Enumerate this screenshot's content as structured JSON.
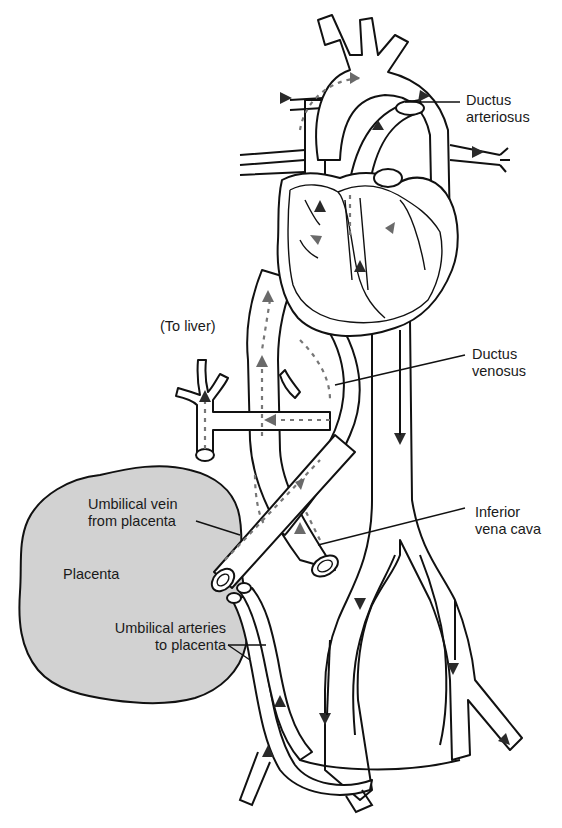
{
  "diagram": {
    "colors": {
      "line": "#111111",
      "placenta_fill": "#d2d2d2",
      "oxygenated_arrow": "#6a6a6a",
      "deoxygenated_arrow": "#2a2a2a",
      "background": "#ffffff"
    },
    "labels": {
      "ductus_arteriosus": {
        "line1": "Ductus",
        "line2": "arteriosus"
      },
      "to_liver": {
        "text": "(To liver)"
      },
      "ductus_venosus": {
        "line1": "Ductus",
        "line2": "venosus"
      },
      "umbilical_vein": {
        "line1": "Umbilical vein",
        "line2": "from placenta"
      },
      "placenta": {
        "text": "Placenta"
      },
      "inferior_vena_cava": {
        "line1": "Inferior",
        "line2": "vena cava"
      },
      "umbilical_arteries": {
        "line1": "Umbilical arteries",
        "line2": "to placenta"
      }
    },
    "structures": [
      "heart",
      "aortic-arch",
      "pulmonary-trunk",
      "ductus-arteriosus",
      "superior-vena-cava",
      "inferior-vena-cava",
      "ductus-venosus",
      "umbilical-vein",
      "umbilical-arteries",
      "placenta",
      "descending-aorta",
      "iliac-arteries",
      "portal-branches-to-liver"
    ]
  }
}
